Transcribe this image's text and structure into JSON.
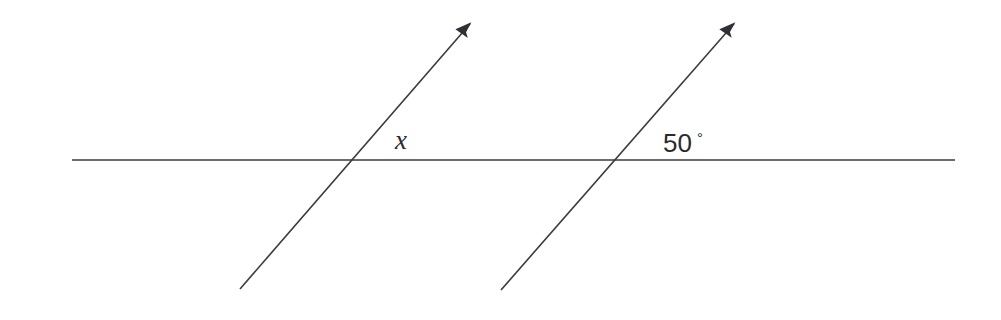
{
  "figure": {
    "background_color": "#ffffff",
    "stroke_color": "#3a3a42",
    "stroke_width": 1.6,
    "labels": {
      "angle_unknown": "x",
      "angle_known_value": "50",
      "angle_known_degree_symbol": "°",
      "angle_known_full": "50°"
    },
    "geometry": {
      "horizontal_line": {
        "name": "horizontal-transversal",
        "x1": 72,
        "y1": 160,
        "x2": 955,
        "y2": 160
      },
      "ray_left": {
        "name": "left-ray",
        "x1": 240,
        "y1": 289,
        "x2": 476,
        "y2": 17,
        "arrowhead_at": "end"
      },
      "ray_right": {
        "name": "right-ray",
        "x1": 501,
        "y1": 290,
        "x2": 740,
        "y2": 17,
        "arrowhead_at": "end"
      },
      "intersection_left": {
        "x": 353,
        "y": 160
      },
      "intersection_right": {
        "x": 618,
        "y": 160
      },
      "label_x_position": {
        "x": 395,
        "y": 149
      },
      "label_angle_position": {
        "x": 663,
        "y": 152
      }
    }
  }
}
